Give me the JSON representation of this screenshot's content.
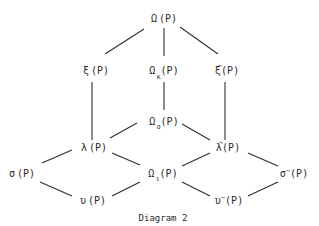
{
  "diagram": {
    "caption": "Diagram 2",
    "colors": {
      "ink": "#2a2a2a",
      "background": "#ffffff"
    },
    "nodes": {
      "omega": {
        "base": "Ω",
        "sub": "",
        "tilde": false,
        "arg": "(P)"
      },
      "xi": {
        "base": "ξ",
        "sub": "",
        "tilde": false,
        "arg": "(P)"
      },
      "omega_kappa": {
        "base": "Ω",
        "sub": "κ",
        "tilde": false,
        "arg": "(P)"
      },
      "xi_tilde": {
        "base": "ξ",
        "sub": "",
        "tilde": true,
        "tilde_mark": "~",
        "arg": "(P)"
      },
      "omega_sigma": {
        "base": "Ω",
        "sub": "σ",
        "tilde": false,
        "arg": "(P)"
      },
      "lambda": {
        "base": "λ",
        "sub": "",
        "tilde": false,
        "arg": "(P)"
      },
      "lambda_tilde": {
        "base": "λ",
        "sub": "",
        "tilde": true,
        "tilde_mark": "~",
        "arg": "(P)"
      },
      "sigma": {
        "base": "σ",
        "sub": "",
        "tilde": false,
        "arg": "(P)"
      },
      "omega_iota": {
        "base": "Ω",
        "sub": "ι",
        "tilde": false,
        "arg": "(P)"
      },
      "sigma_tilde": {
        "base": "σ",
        "sub": "",
        "tilde": true,
        "tilde_mark": "~",
        "arg": "(P)"
      },
      "upsilon": {
        "base": "υ",
        "sub": "",
        "tilde": false,
        "arg": "(P)"
      },
      "upsilon_tilde": {
        "base": "υ",
        "sub": "",
        "tilde": true,
        "tilde_mark": "~",
        "arg": "(P)"
      }
    },
    "edges": [
      [
        "omega",
        "xi"
      ],
      [
        "omega",
        "omega_kappa"
      ],
      [
        "omega",
        "xi_tilde"
      ],
      [
        "xi",
        "lambda"
      ],
      [
        "omega_kappa",
        "omega_sigma"
      ],
      [
        "xi_tilde",
        "lambda_tilde"
      ],
      [
        "omega_sigma",
        "lambda"
      ],
      [
        "omega_sigma",
        "lambda_tilde"
      ],
      [
        "lambda",
        "sigma"
      ],
      [
        "lambda",
        "omega_iota"
      ],
      [
        "lambda_tilde",
        "omega_iota"
      ],
      [
        "lambda_tilde",
        "sigma_tilde"
      ],
      [
        "sigma",
        "upsilon"
      ],
      [
        "omega_iota",
        "upsilon"
      ],
      [
        "omega_iota",
        "upsilon_tilde"
      ],
      [
        "sigma_tilde",
        "upsilon_tilde"
      ]
    ]
  }
}
